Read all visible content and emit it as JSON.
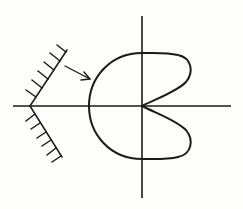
{
  "diagram": {
    "colors": {
      "stroke": "#1a1a1a",
      "background": "#fdfdfb"
    },
    "axes": {
      "horizontal": {
        "x1": 13,
        "y1": 106,
        "x2": 231,
        "y2": 106
      },
      "vertical": {
        "x1": 142,
        "y1": 16,
        "x2": 142,
        "y2": 198
      },
      "origin": [
        142,
        106
      ]
    },
    "curve": {
      "type": "closed-loop-with-cusp",
      "top_crossing": [
        142,
        53
      ],
      "bottom_crossing": [
        142,
        159
      ],
      "leftmost": [
        89,
        106
      ],
      "upper_lobe_rightmost": [
        190,
        72
      ],
      "lower_lobe_rightmost": [
        190,
        140
      ],
      "cusp": [
        142,
        106
      ]
    },
    "wedge": {
      "apex": [
        30,
        106
      ],
      "upper_end": [
        67,
        50
      ],
      "lower_end": [
        62,
        157
      ],
      "hatch_count_upper": 6,
      "hatch_count_lower": 6,
      "hatch_side": "outer-left"
    },
    "arrow": {
      "from": [
        65,
        66
      ],
      "to": [
        90,
        79
      ]
    }
  }
}
